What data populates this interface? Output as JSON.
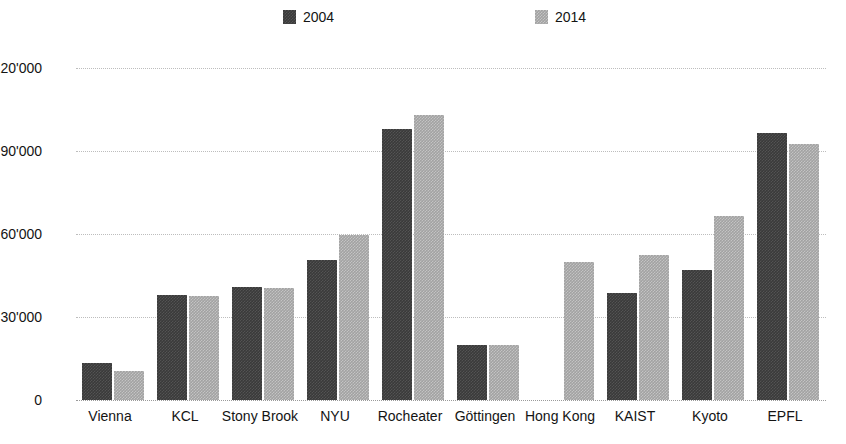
{
  "chart_data": {
    "type": "bar",
    "title": "",
    "xlabel": "",
    "ylabel": "",
    "ylim": [
      0,
      120000
    ],
    "grid": true,
    "legend_position": "top",
    "y_ticks": [
      "0",
      "30'000",
      "60'000",
      "90'000",
      "120'000"
    ],
    "y_tick_values": [
      0,
      30000,
      60000,
      90000,
      120000
    ],
    "categories": [
      "Vienna",
      "KCL",
      "Stony Brook",
      "NYU",
      "Rocheater",
      "Göttingen",
      "Hong Kong",
      "KAIST",
      "Kyoto",
      "EPFL"
    ],
    "series": [
      {
        "name": "2004",
        "color": "#3a3a3a",
        "values": [
          13500,
          38000,
          41000,
          50500,
          98000,
          20000,
          null,
          38500,
          47000,
          96500
        ]
      },
      {
        "name": "2014",
        "color": "#a2a2a2",
        "values": [
          10500,
          37500,
          40500,
          59500,
          103000,
          20000,
          50000,
          52500,
          66500,
          92500
        ]
      }
    ]
  },
  "legend": {
    "entries": [
      {
        "label": "2004"
      },
      {
        "label": "2014"
      }
    ]
  }
}
